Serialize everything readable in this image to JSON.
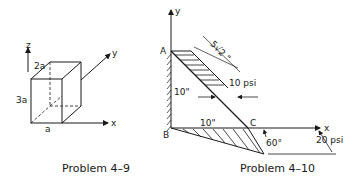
{
  "problem_4_9": {
    "caption": "Problem 4–9",
    "axes": {
      "x": "x",
      "y": "y",
      "z": "z"
    },
    "dimensions": {
      "height": "3a",
      "depth": "2a",
      "width": "a"
    }
  },
  "problem_4_10": {
    "caption": "Problem 4–10",
    "axes": {
      "x": "x",
      "y": "y"
    },
    "points": {
      "A": "A",
      "B": "B",
      "C": "C"
    },
    "dimensions": {
      "vertical": "10\"",
      "horizontal": "10\"",
      "inclined": "5√2 \""
    },
    "loads": {
      "top": "10 psi",
      "bottom": "20 psi"
    },
    "angle": "60°"
  },
  "colors": {
    "ink": "#1a1a1a",
    "background": "#ffffff"
  }
}
